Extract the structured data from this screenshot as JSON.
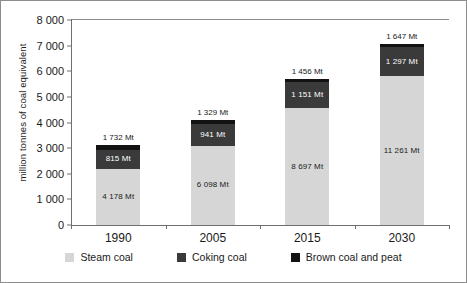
{
  "chart_data": {
    "type": "bar",
    "stacked": true,
    "title": "",
    "subtitle": "",
    "xlabel": "",
    "ylabel": "million tonnes of coal equivalent",
    "ylim": [
      0,
      8000
    ],
    "ytick_labels": [
      "8 000",
      "7 000",
      "6 000",
      "5 000",
      "4 000",
      "3 000",
      "2 000",
      "1 000",
      "0"
    ],
    "ytick_values": [
      8000,
      7000,
      6000,
      5000,
      4000,
      3000,
      2000,
      1000,
      0
    ],
    "grid": false,
    "legend_position": "bottom",
    "categories": [
      "1990",
      "2005",
      "2015",
      "2030"
    ],
    "series": [
      {
        "name": "Steam coal",
        "color": "#d6d6d6",
        "values": [
          2200,
          3100,
          4550,
          5800
        ],
        "labels": [
          "4 178 Mt",
          "6 098 Mt",
          "8 697 Mt",
          "11 261 Mt"
        ]
      },
      {
        "name": "Coking coal",
        "color": "#3a3a3a",
        "values": [
          730,
          830,
          1020,
          1130
        ],
        "labels": [
          "815 Mt",
          "941 Mt",
          "1 151 Mt",
          "1 297 Mt"
        ]
      },
      {
        "name": "Brown coal and peat",
        "color": "#121212",
        "values": [
          210,
          180,
          130,
          140
        ],
        "labels": [
          "",
          "",
          "",
          ""
        ]
      }
    ],
    "top_labels": [
      "1 732 Mt",
      "1 329 Mt",
      "1 456 Mt",
      "1 647 Mt"
    ],
    "totals": [
      3140,
      4110,
      5700,
      7070
    ]
  },
  "legend": {
    "items": [
      {
        "label": "Steam coal",
        "color": "#d6d6d6"
      },
      {
        "label": "Coking coal",
        "color": "#3a3a3a"
      },
      {
        "label": "Brown coal and peat",
        "color": "#121212"
      }
    ]
  }
}
